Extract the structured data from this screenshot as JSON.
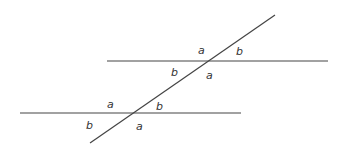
{
  "diagram": {
    "colors": {
      "line": "#444444",
      "label": "#333333",
      "background": "#ffffff"
    },
    "lines": {
      "upper_parallel": {
        "x1": 107,
        "y1": 61,
        "x2": 328,
        "y2": 61
      },
      "lower_parallel": {
        "x1": 20,
        "y1": 113,
        "x2": 241,
        "y2": 113
      },
      "transversal": {
        "x1": 90,
        "y1": 143,
        "x2": 275,
        "y2": 15
      }
    },
    "labels": {
      "upper_top_left": "a",
      "upper_top_right": "b",
      "upper_bottom_left": "b",
      "upper_bottom_right": "a",
      "lower_top_left": "a",
      "lower_top_right": "b",
      "lower_bottom_left": "b",
      "lower_bottom_right": "a"
    }
  }
}
